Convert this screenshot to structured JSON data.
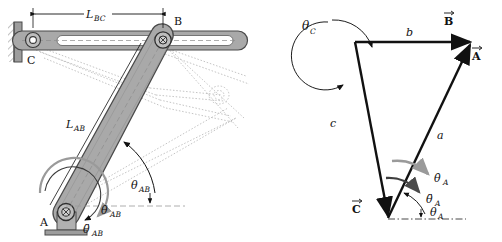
{
  "figure": {
    "background_color": "#ffffff",
    "ink_color": "#111111",
    "link_fill": "#a9a9a9",
    "link_stroke": "#4a4a4a",
    "ghost_color": "#b9b9b9",
    "rate_arrow_color": "#9a9a9a",
    "accel_arrow_color": "#4a4a4a"
  },
  "left_diagram": {
    "name": "linkage-mechanism",
    "joints": {
      "C": {
        "label": "C",
        "x": 33,
        "y": 40
      },
      "B": {
        "label": "B",
        "x": 163,
        "y": 40
      },
      "A": {
        "label": "A",
        "x": 66,
        "y": 212
      }
    },
    "dimensions": [
      {
        "label": "L",
        "sub": "BC",
        "x": 92,
        "y": 16
      },
      {
        "label": "L",
        "sub": "AB",
        "x": 78,
        "y": 127
      }
    ],
    "angles": [
      {
        "label": "θ",
        "sub": "AB",
        "x": 137,
        "y": 187,
        "kind": "angle"
      },
      {
        "label": "θ̇",
        "sub": "AB",
        "x": 106,
        "y": 211,
        "kind": "angular-velocity"
      },
      {
        "label": "θ̈",
        "sub": "AB",
        "x": 90,
        "y": 230,
        "kind": "angular-acceleration"
      }
    ],
    "supports": [
      {
        "name": "wall-support-c",
        "type": "pinned-wall"
      },
      {
        "name": "ground-support-a",
        "type": "pinned-ground"
      }
    ],
    "ghost_positions": 3
  },
  "right_diagram": {
    "name": "vector-loop-triangle",
    "vertices": {
      "top_left": {
        "x": 355,
        "y": 42
      },
      "top_right": {
        "x": 472,
        "y": 42
      },
      "bottom": {
        "x": 388,
        "y": 218
      }
    },
    "sides": [
      {
        "label": "b",
        "x": 410,
        "y": 33,
        "vector": "B"
      },
      {
        "label": "a",
        "x": 440,
        "y": 136,
        "vector": "A"
      },
      {
        "label": "c",
        "x": 333,
        "y": 124,
        "vector": "C"
      }
    ],
    "vectors": [
      {
        "label": "B",
        "x": 449,
        "y": 18,
        "accent": "arrow"
      },
      {
        "label": "A",
        "x": 477,
        "y": 53,
        "accent": "arrow"
      },
      {
        "label": "C",
        "x": 355,
        "y": 206,
        "accent": "arrow"
      }
    ],
    "angles": [
      {
        "label": "θ",
        "sub": "C",
        "x": 307,
        "y": 28,
        "kind": "angle"
      },
      {
        "label": "θ",
        "sub": "A",
        "x": 424,
        "y": 213,
        "kind": "angle"
      },
      {
        "label": "θ̇",
        "sub": "A",
        "x": 436,
        "y": 178,
        "kind": "angular-velocity"
      },
      {
        "label": "θ̈",
        "sub": "A",
        "x": 428,
        "y": 199,
        "kind": "angular-acceleration"
      }
    ]
  }
}
